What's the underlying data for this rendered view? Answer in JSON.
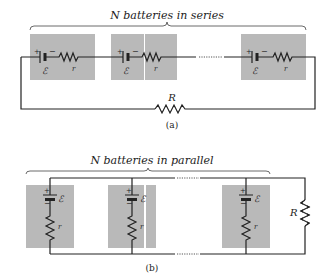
{
  "figure_a": {
    "title": "N batteries in series",
    "caption": "(a)",
    "emf_symbol": "ℰ",
    "internal_resistance_label": "r",
    "load_label": "R",
    "plus": "+",
    "minus": "−",
    "batteries": 3
  },
  "figure_b": {
    "title": "N batteries in parallel",
    "caption": "(b)",
    "emf_symbol": "ℰ",
    "internal_resistance_label": "r",
    "load_label": "R",
    "plus": "+",
    "minus": "−",
    "batteries": 3
  },
  "colors": {
    "box": "#b9b9b9",
    "wire": "#222222"
  }
}
